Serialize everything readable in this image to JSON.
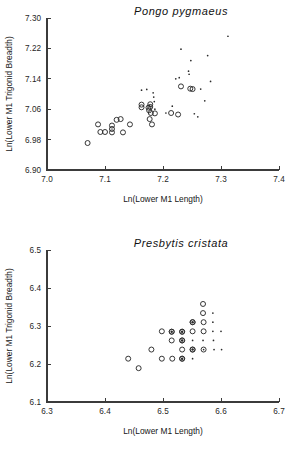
{
  "chart_data": [
    {
      "type": "scatter",
      "id": "pongo",
      "title": "Pongo pygmaeus",
      "xlabel": "Ln(Lower M1 Length)",
      "ylabel": "Ln(Lower M1 Trigonid Breadth)",
      "xlim": [
        7.0,
        7.4
      ],
      "ylim": [
        6.9,
        7.3
      ],
      "xticks": [
        7.0,
        7.1,
        7.2,
        7.3,
        7.4
      ],
      "xticklabels": [
        "7.0",
        "7.1",
        "7.2",
        "7.3",
        "7.4"
      ],
      "yticks": [
        6.9,
        6.98,
        7.06,
        7.14,
        7.22,
        7.3
      ],
      "yticklabels": [
        "6.90",
        "6.98",
        "7.06",
        "7.14",
        "7.22",
        "7.30"
      ],
      "grid": false,
      "legend": "none",
      "series": [
        {
          "name": "open-circle",
          "marker": "open-circle",
          "points": [
            [
              7.07,
              6.971
            ],
            [
              7.088,
              7.02
            ],
            [
              7.092,
              7.0
            ],
            [
              7.1,
              7.0
            ],
            [
              7.112,
              7.017
            ],
            [
              7.112,
              7.008
            ],
            [
              7.112,
              6.999
            ],
            [
              7.12,
              7.032
            ],
            [
              7.127,
              7.034
            ],
            [
              7.131,
              6.999
            ],
            [
              7.143,
              7.02
            ],
            [
              7.163,
              7.072
            ],
            [
              7.163,
              7.065
            ],
            [
              7.175,
              7.064
            ],
            [
              7.176,
              7.057
            ],
            [
              7.177,
              7.034
            ],
            [
              7.178,
              7.073
            ],
            [
              7.178,
              7.066
            ],
            [
              7.179,
              7.05
            ],
            [
              7.181,
              7.02
            ],
            [
              7.186,
              7.049
            ],
            [
              7.214,
              7.05
            ],
            [
              7.226,
              7.046
            ],
            [
              7.231,
              7.12
            ],
            [
              7.247,
              7.114
            ],
            [
              7.251,
              7.113
            ]
          ]
        },
        {
          "name": "small-dot",
          "marker": "dot",
          "points": [
            [
              7.163,
              7.11
            ],
            [
              7.172,
              7.112
            ],
            [
              7.183,
              7.103
            ],
            [
              7.184,
              7.092
            ],
            [
              7.185,
              7.08
            ],
            [
              7.186,
              7.06
            ],
            [
              7.205,
              7.05
            ],
            [
              7.216,
              7.068
            ],
            [
              7.222,
              7.14
            ],
            [
              7.228,
              7.143
            ],
            [
              7.231,
              7.218
            ],
            [
              7.244,
              7.16
            ],
            [
              7.245,
              7.152
            ],
            [
              7.248,
              7.188
            ],
            [
              7.254,
              7.048
            ],
            [
              7.26,
              7.04
            ],
            [
              7.265,
              7.113
            ],
            [
              7.272,
              7.082
            ],
            [
              7.277,
              7.201
            ],
            [
              7.282,
              7.133
            ],
            [
              7.312,
              7.252
            ]
          ]
        }
      ]
    },
    {
      "type": "scatter",
      "id": "presbytis",
      "title": "Presbytis cristata",
      "xlabel": "Ln(Lower M1 Length)",
      "ylabel": "Ln(Lower M1 Trigonid Breadth)",
      "xlim": [
        6.3,
        6.7
      ],
      "ylim": [
        6.1,
        6.5
      ],
      "xticks": [
        6.3,
        6.4,
        6.5,
        6.6,
        6.7
      ],
      "xticklabels": [
        "6.3",
        "6.4",
        "6.5",
        "6.6",
        "6.7"
      ],
      "yticks": [
        6.1,
        6.2,
        6.3,
        6.4,
        6.5
      ],
      "yticklabels": [
        "6.1",
        "6.2",
        "6.3",
        "6.4",
        "6.5"
      ],
      "grid": false,
      "legend": "none",
      "series": [
        {
          "name": "open-circle",
          "marker": "open-circle",
          "points": [
            [
              6.44,
              6.214
            ],
            [
              6.458,
              6.189
            ],
            [
              6.48,
              6.238
            ],
            [
              6.498,
              6.286
            ],
            [
              6.498,
              6.214
            ],
            [
              6.515,
              6.285
            ],
            [
              6.515,
              6.262
            ],
            [
              6.516,
              6.214
            ],
            [
              6.533,
              6.285
            ],
            [
              6.533,
              6.262
            ],
            [
              6.533,
              6.238
            ],
            [
              6.533,
              6.214
            ],
            [
              6.551,
              6.31
            ],
            [
              6.551,
              6.286
            ],
            [
              6.551,
              6.238
            ],
            [
              6.569,
              6.358
            ],
            [
              6.569,
              6.334
            ],
            [
              6.57,
              6.31
            ],
            [
              6.57,
              6.286
            ],
            [
              6.57,
              6.238
            ]
          ]
        },
        {
          "name": "bullseye",
          "marker": "bullseye",
          "points": [
            [
              6.515,
              6.285
            ],
            [
              6.533,
              6.285
            ],
            [
              6.533,
              6.262
            ],
            [
              6.533,
              6.214
            ],
            [
              6.551,
              6.31
            ],
            [
              6.551,
              6.238
            ]
          ]
        },
        {
          "name": "small-dot",
          "marker": "dot",
          "points": [
            [
              6.551,
              6.262
            ],
            [
              6.551,
              6.214
            ],
            [
              6.569,
              6.262
            ],
            [
              6.57,
              6.238
            ],
            [
              6.586,
              6.334
            ],
            [
              6.586,
              6.31
            ],
            [
              6.586,
              6.286
            ],
            [
              6.587,
              6.262
            ],
            [
              6.588,
              6.238
            ],
            [
              6.6,
              6.286
            ],
            [
              6.601,
              6.238
            ]
          ]
        }
      ]
    }
  ]
}
